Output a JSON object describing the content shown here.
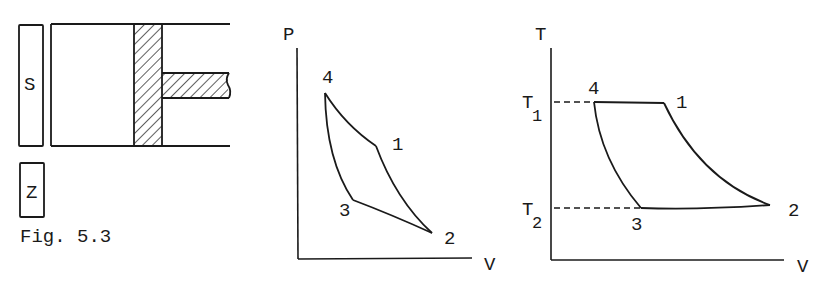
{
  "figure": {
    "caption": "Fig. 5.3",
    "colors": {
      "ink": "#1a1a1a",
      "background": "#ffffff"
    }
  },
  "apparatus": {
    "reservoir_top_label": "S",
    "reservoir_bottom_label": "Z",
    "cylinder": "cylinder-with-hatched-piston-and-rod"
  },
  "pv_diagram": {
    "y_axis_label": "P",
    "x_axis_label": "V",
    "points": [
      {
        "label": "4",
        "x": 325,
        "y": 93
      },
      {
        "label": "1",
        "x": 376,
        "y": 146
      },
      {
        "label": "2",
        "x": 432,
        "y": 233
      },
      {
        "label": "3",
        "x": 353,
        "y": 200
      }
    ]
  },
  "tv_diagram": {
    "y_axis_label": "T",
    "x_axis_label": "V",
    "t1_label": "T",
    "t1_sub": "1",
    "t2_label": "T",
    "t2_sub": "2",
    "points": [
      {
        "label": "4",
        "x": 594,
        "y": 102
      },
      {
        "label": "1",
        "x": 664,
        "y": 102
      },
      {
        "label": "2",
        "x": 770,
        "y": 205
      },
      {
        "label": "3",
        "x": 641,
        "y": 208
      }
    ]
  }
}
